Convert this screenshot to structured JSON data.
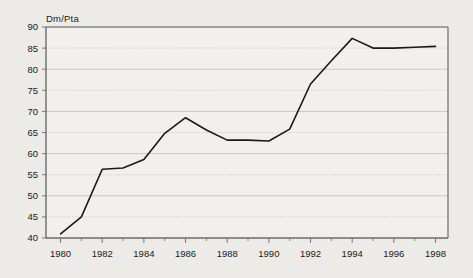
{
  "chart_data": {
    "type": "line",
    "title": "",
    "subtitle": "",
    "ylabel": "Dm/Pta",
    "xlabel": "",
    "x": [
      1980,
      1981,
      1982,
      1983,
      1984,
      1985,
      1986,
      1987,
      1988,
      1989,
      1990,
      1991,
      1992,
      1993,
      1994,
      1995,
      1996,
      1997,
      1998
    ],
    "values": [
      41.0,
      45.0,
      56.3,
      56.6,
      58.6,
      64.8,
      68.5,
      65.6,
      63.2,
      63.2,
      63.0,
      65.8,
      76.5,
      82.0,
      87.3,
      85.0,
      85.0,
      85.2,
      85.4
    ],
    "series": [
      {
        "name": "Dm/Pta",
        "values": [
          41.0,
          45.0,
          56.3,
          56.6,
          58.6,
          64.8,
          68.5,
          65.6,
          63.2,
          63.2,
          63.0,
          65.8,
          76.5,
          82.0,
          87.3,
          85.0,
          85.0,
          85.2,
          85.4
        ]
      }
    ],
    "xlim": [
      1979.3,
      1998.6
    ],
    "ylim": [
      40,
      90
    ],
    "ytick_labels": [
      "40",
      "45",
      "50",
      "55",
      "60",
      "65",
      "70",
      "75",
      "80",
      "85",
      "90"
    ],
    "yticks": [
      40,
      45,
      50,
      55,
      60,
      65,
      70,
      75,
      80,
      85,
      90
    ],
    "xtick_labels": [
      "1980",
      "1982",
      "1984",
      "1986",
      "1988",
      "1990",
      "1992",
      "1994",
      "1996",
      "1998"
    ],
    "xticks": [
      1980,
      1982,
      1984,
      1986,
      1988,
      1990,
      1992,
      1994,
      1996,
      1998
    ],
    "x_minor_ticks": [
      1981,
      1983,
      1985,
      1987,
      1989,
      1991,
      1993,
      1995,
      1997
    ],
    "grid": "horizontal",
    "legend": "none",
    "line_color": "#1a1a1a",
    "grid_color": "#b9b7b3",
    "axis_color": "#6b6b6b",
    "background_color": "#edebe7",
    "plot_background_color": "#f2f0ec"
  }
}
